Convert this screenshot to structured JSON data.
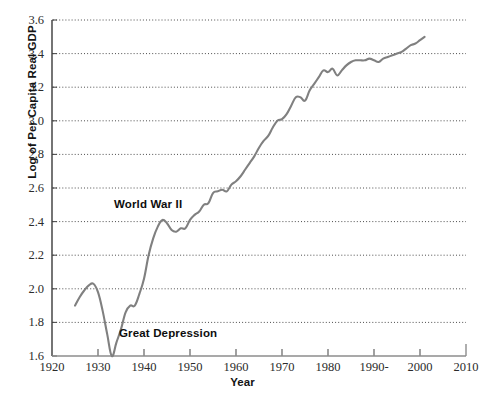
{
  "chart_data": {
    "type": "line",
    "title": "",
    "xlabel": "Year",
    "ylabel": "Log of Per Capita Real GDP",
    "xlim": [
      1920,
      2010
    ],
    "ylim": [
      1.6,
      3.6
    ],
    "xticks": [
      1920,
      1930,
      1940,
      1950,
      1960,
      1970,
      1980,
      1990,
      2000,
      2010
    ],
    "xtick_labels": [
      "1920",
      "1930",
      "1940",
      "1950",
      "1960",
      "1970",
      "1980",
      "1990-",
      "2000",
      "2010"
    ],
    "yticks": [
      1.6,
      1.8,
      2.0,
      2.2,
      2.4,
      2.6,
      2.8,
      3.0,
      3.2,
      3.4,
      3.6
    ],
    "ytick_labels": [
      "1.6",
      "1.8",
      "2.0",
      "2.2",
      "2.4",
      "2.6",
      "2.8",
      "3.0",
      "3.2",
      "3.4",
      "3.6"
    ],
    "grid": "horizontal-dotted",
    "legend": "none",
    "line_color": "#808080",
    "series": [
      {
        "name": "Log of Per Capita Real GDP",
        "x": [
          1925,
          1926,
          1927,
          1928,
          1929,
          1930,
          1931,
          1932,
          1933,
          1934,
          1935,
          1936,
          1937,
          1938,
          1939,
          1940,
          1941,
          1942,
          1943,
          1944,
          1945,
          1946,
          1947,
          1948,
          1949,
          1950,
          1951,
          1952,
          1953,
          1954,
          1955,
          1956,
          1957,
          1958,
          1959,
          1960,
          1961,
          1962,
          1963,
          1964,
          1965,
          1966,
          1967,
          1968,
          1969,
          1970,
          1971,
          1972,
          1973,
          1974,
          1975,
          1976,
          1977,
          1978,
          1979,
          1980,
          1981,
          1982,
          1983,
          1984,
          1985,
          1986,
          1987,
          1988,
          1989,
          1990,
          1991,
          1992,
          1993,
          1994,
          1995,
          1996,
          1997,
          1998,
          1999,
          2000,
          2001
        ],
        "y": [
          1.9,
          1.95,
          1.99,
          2.02,
          2.03,
          1.98,
          1.87,
          1.73,
          1.6,
          1.68,
          1.76,
          1.86,
          1.9,
          1.9,
          1.97,
          2.06,
          2.2,
          2.3,
          2.37,
          2.41,
          2.39,
          2.35,
          2.34,
          2.36,
          2.36,
          2.41,
          2.44,
          2.46,
          2.5,
          2.51,
          2.57,
          2.58,
          2.59,
          2.58,
          2.62,
          2.64,
          2.67,
          2.71,
          2.75,
          2.79,
          2.84,
          2.88,
          2.91,
          2.96,
          3.0,
          3.01,
          3.04,
          3.09,
          3.14,
          3.14,
          3.12,
          3.18,
          3.22,
          3.26,
          3.3,
          3.29,
          3.31,
          3.27,
          3.3,
          3.33,
          3.35,
          3.36,
          3.36,
          3.36,
          3.37,
          3.36,
          3.35,
          3.37,
          3.38,
          3.39,
          3.4,
          3.41,
          3.43,
          3.45,
          3.46,
          3.48,
          3.5
        ]
      }
    ],
    "annotations": [
      {
        "text": "World War II",
        "x": 1945.5,
        "y": 2.47
      },
      {
        "text": "Great Depression",
        "x": 1936.5,
        "y": 1.665
      }
    ]
  }
}
